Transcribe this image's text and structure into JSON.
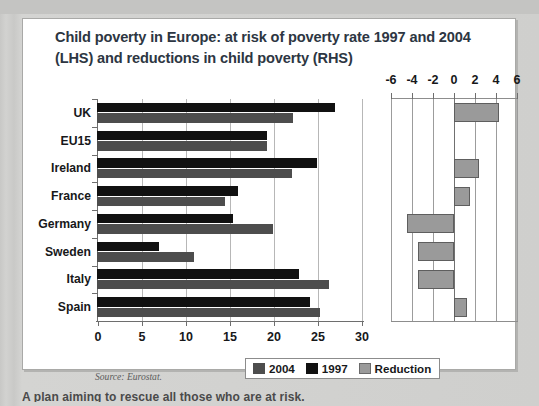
{
  "figure": {
    "title_line1": "Child poverty in Europe: at risk of poverty rate 1997 and 2004",
    "title_line2": "(LHS) and reductions in child poverty (RHS)",
    "source": "Source: Eurostat.",
    "footer_fragment": "A plan aiming to rescue all those who are at risk."
  },
  "legend": {
    "items": [
      {
        "label": "2004",
        "color": "#4d4d4d"
      },
      {
        "label": "1997",
        "color": "#111111"
      },
      {
        "label": "Reduction",
        "color": "#9a9a9a"
      }
    ]
  },
  "chart_data": {
    "type": "bar",
    "orientation": "horizontal",
    "title": "Child poverty in Europe: at risk of poverty rate 1997 and 2004 (LHS) and reductions in child poverty (RHS)",
    "xlabel": "",
    "ylabel": "",
    "categories": [
      "UK",
      "EU15",
      "Ireland",
      "France",
      "Germany",
      "Sweden",
      "Italy",
      "Spain"
    ],
    "series": [
      {
        "name": "1997",
        "axis": "LHS",
        "color": "#111111",
        "values": [
          27.0,
          19.3,
          25.0,
          16.0,
          15.5,
          7.0,
          23.0,
          24.2
        ]
      },
      {
        "name": "2004",
        "axis": "LHS",
        "color": "#4d4d4d",
        "values": [
          22.3,
          19.3,
          22.2,
          14.5,
          20.0,
          11.0,
          26.4,
          25.3
        ]
      },
      {
        "name": "Reduction",
        "axis": "RHS",
        "color": "#9a9a9a",
        "values": [
          4.3,
          0.0,
          2.4,
          1.5,
          -4.5,
          -3.4,
          -3.4,
          1.2
        ]
      }
    ],
    "lhs_axis": {
      "label": "LHS",
      "ticks": [
        0,
        5,
        10,
        15,
        20,
        25,
        30
      ],
      "tick_labels": [
        "0",
        "5",
        "10",
        "15",
        "20",
        "25",
        "30"
      ],
      "min": 0,
      "max": 30,
      "grid": true
    },
    "rhs_axis": {
      "label": "RHS",
      "position": "top",
      "ticks": [
        -6,
        -4,
        -2,
        0,
        2,
        4,
        6
      ],
      "tick_labels": [
        "-6",
        "-4",
        "-2",
        "0",
        "2",
        "4",
        "6"
      ],
      "min": -6,
      "max": 6,
      "grid": true
    },
    "legend_position": "bottom-center"
  }
}
